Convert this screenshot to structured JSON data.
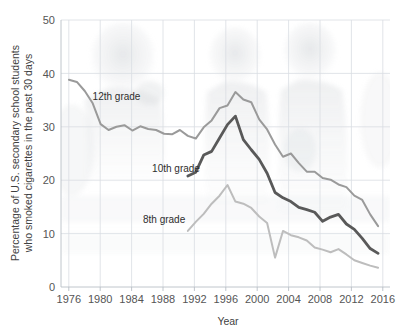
{
  "chart_data": {
    "type": "line",
    "title": "",
    "xlabel": "Year",
    "ylabel": "Percentage of U.S. secondary school students who smoked cigarettes in the past 30 days",
    "ylabel_line1": "Percentage of U.S. secondary school students",
    "ylabel_line2": "who smoked cigarettes in the past 30 days",
    "xlim": [
      1975,
      2016.5
    ],
    "ylim": [
      0,
      50
    ],
    "xticks": [
      1976,
      1980,
      1984,
      1988,
      1992,
      1996,
      2000,
      2004,
      2008,
      2012,
      2016
    ],
    "xtick_labels": [
      "1976",
      "1980",
      "1984",
      "1988",
      "1992",
      "1996",
      "2000",
      "2004",
      "2008",
      "2012",
      "2016"
    ],
    "yticks": [
      0,
      10,
      20,
      30,
      40,
      50
    ],
    "ytick_labels": [
      "0",
      "10",
      "20",
      "30",
      "40",
      "50"
    ],
    "grid": true,
    "grid_axis": "both",
    "legend": "inline-labels",
    "series": [
      {
        "name": "12th grade",
        "color": "#9a9a9a",
        "width": 2.0,
        "label_x": 1982.0,
        "label_y": 35.0,
        "x": [
          1976,
          1977,
          1978,
          1979,
          1980,
          1981,
          1982,
          1983,
          1984,
          1985,
          1986,
          1987,
          1988,
          1989,
          1990,
          1991,
          1992,
          1993,
          1994,
          1995,
          1996,
          1997,
          1998,
          1999,
          2000,
          2001,
          2002,
          2003,
          2004,
          2005,
          2006,
          2007,
          2008,
          2009,
          2010,
          2011,
          2012,
          2013,
          2014,
          2015
        ],
        "values": [
          38.8,
          38.4,
          36.7,
          34.4,
          30.5,
          29.4,
          30.0,
          30.3,
          29.3,
          30.1,
          29.6,
          29.4,
          28.7,
          28.6,
          29.4,
          28.3,
          27.8,
          29.9,
          31.2,
          33.5,
          34.0,
          36.5,
          35.1,
          34.6,
          31.4,
          29.5,
          26.7,
          24.4,
          25.0,
          23.2,
          21.6,
          21.6,
          20.4,
          20.1,
          19.2,
          18.7,
          17.1,
          16.3,
          13.6,
          11.4
        ]
      },
      {
        "name": "10th grade",
        "color": "#595959",
        "width": 2.8,
        "label_x": 1989.5,
        "label_y": 21.5,
        "x": [
          1991,
          1992,
          1993,
          1994,
          1995,
          1996,
          1997,
          1998,
          1999,
          2000,
          2001,
          2002,
          2003,
          2004,
          2005,
          2006,
          2007,
          2008,
          2009,
          2010,
          2011,
          2012,
          2013,
          2014,
          2015
        ],
        "values": [
          20.8,
          21.5,
          24.7,
          25.4,
          27.9,
          30.4,
          32.0,
          27.6,
          25.7,
          23.9,
          21.3,
          17.7,
          16.7,
          16.0,
          14.9,
          14.5,
          14.0,
          12.3,
          13.1,
          13.6,
          11.8,
          10.8,
          9.1,
          7.2,
          6.3
        ]
      },
      {
        "name": "8th grade",
        "color": "#bdbdbd",
        "width": 2.0,
        "label_x": 1988.0,
        "label_y": 12.0,
        "x": [
          1991,
          1992,
          1993,
          1994,
          1995,
          1996,
          1997,
          1998,
          1999,
          2000,
          2001,
          2002,
          2003,
          2004,
          2005,
          2006,
          2007,
          2008,
          2009,
          2010,
          2011,
          2012,
          2013,
          2014,
          2015
        ],
        "values": [
          10.5,
          12.2,
          13.7,
          15.6,
          17.1,
          19.1,
          16.0,
          15.6,
          14.8,
          13.2,
          12.0,
          5.5,
          10.5,
          9.7,
          9.3,
          8.7,
          7.4,
          7.0,
          6.5,
          7.1,
          6.1,
          5.0,
          4.5,
          4.0,
          3.6
        ]
      }
    ]
  },
  "axis": {
    "x_title": "Year",
    "y_title_line1": "Percentage of U.S. secondary school students",
    "y_title_line2": "who smoked cigarettes in the past 30 days"
  },
  "colors": {
    "grade12": "#9a9a9a",
    "grade10": "#595959",
    "grade8": "#bdbdbd",
    "grid": "#d9dde2",
    "axis": "#b9bfc6",
    "text": "#4a4a4a",
    "background": "#ffffff"
  }
}
